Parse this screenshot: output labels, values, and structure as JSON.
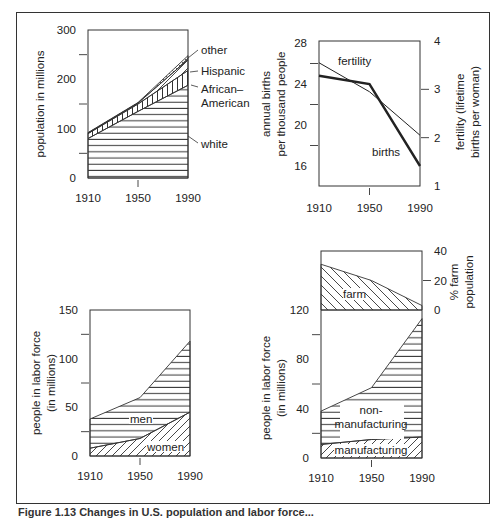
{
  "figure": {
    "caption": "Figure 1.13 Changes in U.S. population and labor force..."
  },
  "chart_data": [
    {
      "id": "population",
      "type": "area",
      "stacked": true,
      "x": [
        1910,
        1950,
        1990
      ],
      "xticks": [
        "1910",
        "1950",
        "1990"
      ],
      "ylabel": "population in millions",
      "ylim": [
        0,
        300
      ],
      "yticks": [
        "0",
        "100",
        "200",
        "300"
      ],
      "series": [
        {
          "name": "white",
          "values": [
            80,
            135,
            188
          ],
          "pattern": "horizontal"
        },
        {
          "name": "African–American",
          "values": [
            10,
            15,
            30
          ],
          "pattern": "vertical"
        },
        {
          "name": "Hispanic",
          "values": [
            1,
            2,
            22
          ],
          "pattern": "diagonal"
        },
        {
          "name": "other",
          "values": [
            1,
            1,
            8
          ],
          "pattern": "crosshatch"
        }
      ],
      "labels": [
        "other",
        "Hispanic",
        "African–",
        "American",
        "white"
      ]
    },
    {
      "id": "births_fertility",
      "type": "line",
      "x": [
        1910,
        1950,
        1990
      ],
      "xticks": [
        "1910",
        "1950",
        "1990"
      ],
      "ylabel_left": [
        "annual births",
        "per thousand people"
      ],
      "ylim_left": [
        14,
        28
      ],
      "yticks_left": [
        "16",
        "20",
        "24",
        "28"
      ],
      "ylabel_right": [
        "fertility (lifetime",
        "births per woman)"
      ],
      "ylim_right": [
        1,
        4
      ],
      "yticks_right": [
        "1",
        "2",
        "3",
        "4"
      ],
      "series": [
        {
          "name": "births",
          "axis": "left",
          "values": [
            24.8,
            24.0,
            16.0
          ],
          "style": "thick"
        },
        {
          "name": "fertility",
          "axis": "right",
          "values": [
            3.55,
            2.95,
            2.05
          ],
          "style": "thin"
        }
      ]
    },
    {
      "id": "labor_force_sex",
      "type": "area",
      "stacked": true,
      "x": [
        1910,
        1950,
        1990
      ],
      "xticks": [
        "1910",
        "1950",
        "1990"
      ],
      "ylabel": [
        "people in labor force",
        "(in millions)"
      ],
      "ylim": [
        0,
        150
      ],
      "yticks": [
        "0",
        "50",
        "100",
        "150"
      ],
      "series": [
        {
          "name": "women",
          "values": [
            8,
            18,
            45
          ],
          "pattern": "diagonal"
        },
        {
          "name": "men",
          "values": [
            30,
            42,
            73
          ],
          "pattern": "horizontal"
        }
      ]
    },
    {
      "id": "labor_force_sector",
      "type": "area",
      "stacked": true,
      "x": [
        1910,
        1950,
        1990
      ],
      "xticks": [
        "1910",
        "1950",
        "1990"
      ],
      "ylabel": [
        "people in labor force",
        "(in millions)"
      ],
      "ylim": [
        0,
        120
      ],
      "yticks": [
        "0",
        "40",
        "80",
        "120"
      ],
      "series": [
        {
          "name": "manufacturing",
          "values": [
            11,
            15,
            17
          ],
          "pattern": "diagonal"
        },
        {
          "name": "non-manufacturing",
          "values": [
            27,
            42,
            96
          ],
          "pattern": "horizontal"
        }
      ],
      "labels": [
        "non-",
        "manufacturing",
        "manufacturing"
      ],
      "inset": {
        "name": "farm",
        "type": "area",
        "ylabel": [
          "% farm",
          "population"
        ],
        "ylim": [
          0,
          40
        ],
        "yticks": [
          "0",
          "20",
          "40"
        ],
        "values": [
          31,
          20,
          3
        ],
        "pattern": "back-diagonal"
      }
    }
  ]
}
